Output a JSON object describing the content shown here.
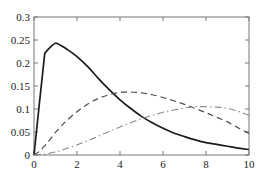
{
  "chart_data": {
    "type": "line",
    "title": "",
    "xlabel": "",
    "ylabel": "",
    "xlim": [
      0,
      10
    ],
    "ylim": [
      0,
      0.3
    ],
    "grid": false,
    "legend": null,
    "xticks": [
      0,
      2,
      4,
      6,
      8,
      10
    ],
    "xtick_labels": [
      "0",
      "2",
      "4",
      "6",
      "8",
      "10"
    ],
    "yticks": [
      0,
      0.05,
      0.1,
      0.15,
      0.2,
      0.25,
      0.3
    ],
    "ytick_labels": [
      "0",
      "0.05",
      "0.1",
      "0.15",
      "0.2",
      "0.25",
      "0.3"
    ],
    "x": [
      0,
      0.25,
      0.5,
      0.75,
      1.0,
      1.25,
      1.5,
      2.0,
      2.5,
      3.0,
      3.5,
      4.0,
      4.5,
      5.0,
      5.5,
      6.0,
      6.5,
      7.0,
      7.5,
      8.0,
      8.5,
      9.0,
      9.5,
      10.0
    ],
    "series": [
      {
        "name": "solid-curve",
        "style": "solid",
        "color": "#1b1b1b",
        "values": [
          0.0,
          0.112,
          0.221,
          0.234,
          0.243,
          0.238,
          0.231,
          0.214,
          0.192,
          0.166,
          0.142,
          0.12,
          0.101,
          0.084,
          0.07,
          0.058,
          0.048,
          0.04,
          0.033,
          0.027,
          0.023,
          0.019,
          0.015,
          0.012
        ]
      },
      {
        "name": "dashed-curve",
        "style": "dashed",
        "color": "#4d4d4d",
        "values": [
          0.0,
          0.008,
          0.02,
          0.034,
          0.049,
          0.062,
          0.074,
          0.094,
          0.111,
          0.123,
          0.131,
          0.136,
          0.137,
          0.135,
          0.131,
          0.125,
          0.118,
          0.11,
          0.101,
          0.092,
          0.082,
          0.072,
          0.059,
          0.047
        ]
      },
      {
        "name": "dashdot-curve",
        "style": "dashdot",
        "color": "#8c8c8c",
        "values": [
          0.0,
          0.001,
          0.002,
          0.004,
          0.007,
          0.01,
          0.014,
          0.022,
          0.031,
          0.041,
          0.051,
          0.061,
          0.07,
          0.079,
          0.086,
          0.093,
          0.098,
          0.102,
          0.105,
          0.105,
          0.104,
          0.101,
          0.095,
          0.086
        ]
      }
    ]
  },
  "axes": {
    "frame_color": "#777777",
    "tick_direction": "in",
    "box": true
  }
}
